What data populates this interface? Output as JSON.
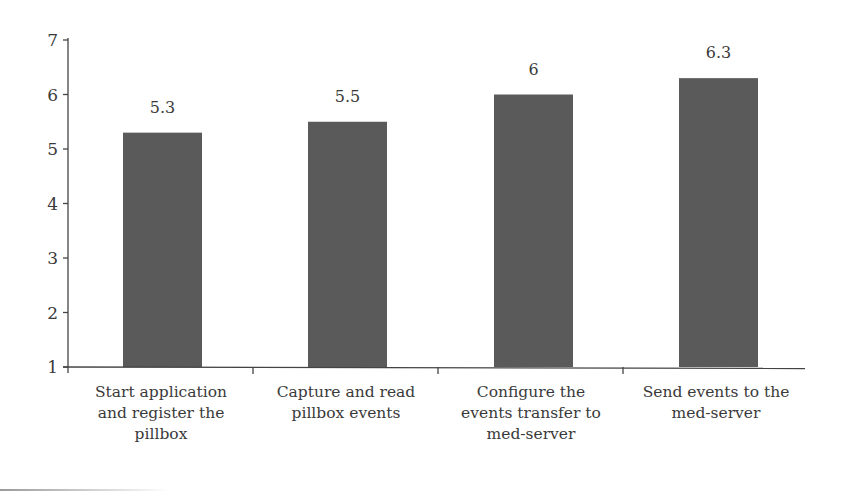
{
  "chart_data": {
    "type": "bar",
    "title": "",
    "xlabel": "",
    "ylabel": "",
    "categories": [
      "Start application and register the pillbox",
      "Capture and read pillbox events",
      "Configure the events transfer to med-server",
      "Send events to the med-server"
    ],
    "category_lines": [
      [
        "Start application",
        "and register the",
        "pillbox"
      ],
      [
        "Capture and read",
        "pillbox events"
      ],
      [
        "Configure the",
        "events transfer to",
        "med-server"
      ],
      [
        "Send events to the",
        "med-server"
      ]
    ],
    "values": [
      5.3,
      5.5,
      6,
      6.3
    ],
    "value_labels": [
      "5.3",
      "5.5",
      "6",
      "6.3"
    ],
    "ylim": [
      1,
      7
    ],
    "yticks": [
      1,
      2,
      3,
      4,
      5,
      6,
      7
    ],
    "grid": false,
    "legend": null,
    "colors": {
      "bar": "#5a5a5a",
      "axis": "#444444",
      "text": "#3a3a3a"
    }
  }
}
